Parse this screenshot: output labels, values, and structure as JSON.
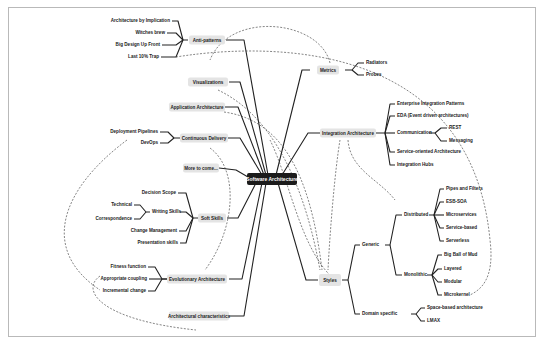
{
  "title": "Software Architecture",
  "colors": {
    "center_bg": "#1b1b1b",
    "box_bg": "#e4e4e4",
    "line": "#222222",
    "frame": "#b9b9b9"
  },
  "left": {
    "anti_patterns": {
      "label": "Anti-patterns",
      "children": [
        "Architecture by Implication",
        "Witches brew",
        "Big Design Up Front",
        "Last 10% Trap"
      ]
    },
    "visualizations": {
      "label": "Visualizations"
    },
    "application_architecture": {
      "label": "Application Architecture"
    },
    "continuous_delivery": {
      "label": "Continuous Delivery",
      "children": [
        "Deployment Pipelines",
        "DevOps"
      ]
    },
    "more_to_come": {
      "label": "More to come..."
    },
    "soft_skills": {
      "label": "Soft Skills",
      "decision_scope": "Decision Scope",
      "writing_skills": {
        "label": "Writing Skills",
        "children": [
          "Technical",
          "Correspondence"
        ]
      },
      "change_management": "Change Management",
      "presentation_skills": "Presentation skills"
    },
    "evolutionary_architecture": {
      "label": "Evolutionary Architecture",
      "children": [
        "Fitness function",
        "Appropriate coupling",
        "Incremental change"
      ]
    },
    "architectural_characteristics": {
      "label": "Architectural characteristics"
    }
  },
  "right": {
    "metrics": {
      "label": "Metrics",
      "children": [
        "Radiators",
        "Probes"
      ]
    },
    "integration_architecture": {
      "label": "Integration Architecture",
      "eip": "Enterprise Integration Patterns",
      "eda": "EDA (Event driven architectures)",
      "communication": {
        "label": "Communication",
        "children": [
          "REST",
          "Messaging"
        ]
      },
      "soa": "Service-oriented Architecture",
      "hubs": "Integration Hubs"
    },
    "styles": {
      "label": "Styles",
      "generic": {
        "label": "Generic",
        "distributed": {
          "label": "Distributed",
          "children": [
            "Pipes and Filters",
            "ESB-SOA",
            "Microservices",
            "Service-based",
            "Serverless"
          ]
        },
        "monolithic": {
          "label": "Monolithic",
          "children": [
            "Big Ball of Mud",
            "Layered",
            "Modular",
            "Microkernel"
          ]
        }
      },
      "domain_specific": {
        "label": "Domain specific",
        "children": [
          "Space-based architecture",
          "LMAX"
        ]
      }
    }
  }
}
